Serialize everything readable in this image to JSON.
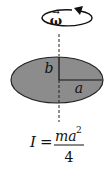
{
  "diagram": {
    "rotation_label": "ω",
    "rotation_vector_arrow": "→",
    "semi_major_label": "a",
    "semi_minor_label": "b",
    "ellipse_fill": "#8c8c8c",
    "ellipse_stroke": "#222222"
  },
  "formula": {
    "lhs": "I",
    "equals": "=",
    "numerator_base": "ma",
    "numerator_exponent": "2",
    "denominator": "4"
  }
}
